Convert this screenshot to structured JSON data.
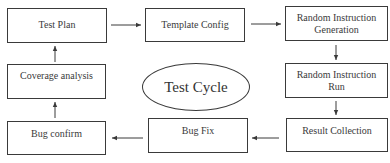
{
  "diagram": {
    "center_label": "Test Cycle",
    "nodes": [
      {
        "id": "test-plan",
        "lines": [
          "Test Plan",
          ""
        ]
      },
      {
        "id": "template-config",
        "lines": [
          "Template Config",
          ""
        ]
      },
      {
        "id": "random-instruction-generation",
        "lines": [
          "Random Instruction",
          "Generation"
        ]
      },
      {
        "id": "random-instruction-run",
        "lines": [
          "Random Instruction",
          "Run"
        ]
      },
      {
        "id": "result-collection",
        "lines": [
          "Result Collection",
          ""
        ]
      },
      {
        "id": "bug-fix",
        "lines": [
          "Bug Fix",
          ""
        ]
      },
      {
        "id": "bug-confirm",
        "lines": [
          "Bug confirm",
          ""
        ]
      },
      {
        "id": "coverage-analysis",
        "lines": [
          "Coverage analysis",
          ""
        ]
      }
    ],
    "edges": [
      {
        "from": "test-plan",
        "to": "template-config"
      },
      {
        "from": "template-config",
        "to": "random-instruction-generation"
      },
      {
        "from": "random-instruction-generation",
        "to": "random-instruction-run"
      },
      {
        "from": "random-instruction-run",
        "to": "result-collection"
      },
      {
        "from": "result-collection",
        "to": "bug-fix"
      },
      {
        "from": "bug-fix",
        "to": "bug-confirm"
      },
      {
        "from": "bug-confirm",
        "to": "coverage-analysis"
      },
      {
        "from": "coverage-analysis",
        "to": "test-plan"
      }
    ],
    "colors": {
      "stroke": "#3a3a3a",
      "background": "#ffffff"
    }
  }
}
